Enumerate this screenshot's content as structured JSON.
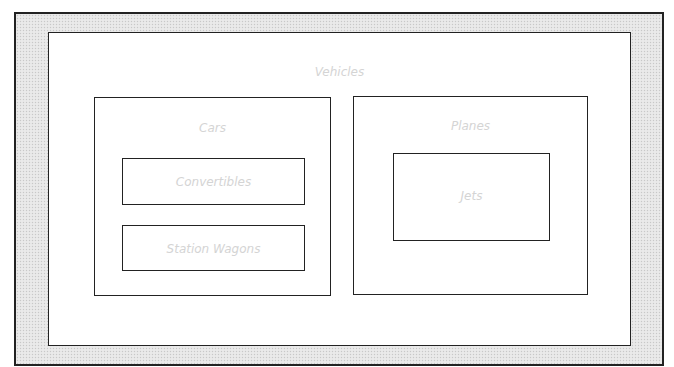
{
  "diagram": {
    "type": "nested-containment",
    "root": {
      "label": "Vehicles",
      "children": [
        {
          "label": "Cars",
          "children": [
            {
              "label": "Convertibles"
            },
            {
              "label": "Station Wagons"
            }
          ]
        },
        {
          "label": "Planes",
          "children": [
            {
              "label": "Jets"
            }
          ]
        }
      ]
    }
  },
  "colors": {
    "border": "#222222",
    "frame_fill": "#e6e6e6",
    "label_text": "#d4d4d4",
    "box_fill": "#ffffff"
  }
}
